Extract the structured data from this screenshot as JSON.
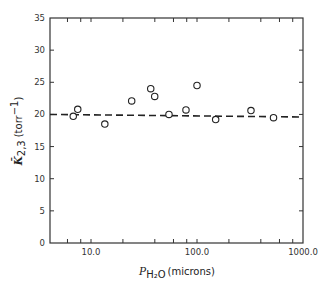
{
  "chart_data": {
    "type": "scatter",
    "title": "",
    "xlabel": "P_H2O (microns)",
    "xlabel_parts": {
      "symbol": "P",
      "subscript": "H₂O",
      "unit": "(microns)"
    },
    "ylabel": "K̄_2,3 (torr^-1)",
    "ylabel_parts": {
      "symbol": "K̄",
      "subscript": "2,3",
      "unit_prefix": "(torr",
      "unit_sup": "−1",
      "unit_suffix": ")"
    },
    "xscale": "log",
    "xlim": [
      4.1,
      1000
    ],
    "ylim": [
      0,
      35
    ],
    "x_tick_labels": [
      "10.0",
      "100.0",
      "1000.0"
    ],
    "x_tick_label_values": [
      10,
      100,
      1000
    ],
    "x_minor_ticks": [
      6,
      8,
      10,
      20,
      40,
      60,
      80,
      100,
      200,
      400,
      600,
      800
    ],
    "y_ticks": [
      0,
      5,
      10,
      15,
      20,
      25,
      30,
      35
    ],
    "y_tick_labels": [
      "0",
      "5",
      "10",
      "15",
      "20",
      "25",
      "30",
      "35"
    ],
    "grid": false,
    "legend": null,
    "series": [
      {
        "name": "measurements",
        "marker": "open-circle",
        "x": [
          6.8,
          7.5,
          13.5,
          24.2,
          36.6,
          39.9,
          54.4,
          78.7,
          100,
          150,
          323,
          527
        ],
        "y": [
          19.7,
          20.8,
          18.5,
          22.1,
          24.0,
          22.8,
          20.0,
          20.7,
          24.5,
          19.2,
          20.6,
          19.5
        ]
      },
      {
        "name": "mean-fit",
        "style": "dashed",
        "x": [
          4.1,
          1000
        ],
        "y": [
          20.0,
          19.6
        ]
      }
    ]
  }
}
